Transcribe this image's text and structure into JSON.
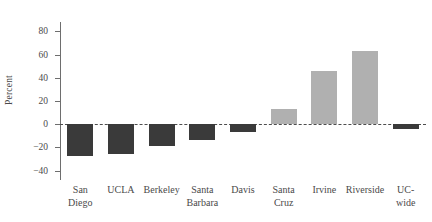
{
  "chart_data": {
    "type": "bar",
    "title": "",
    "subtitle": "",
    "xlabel": "",
    "ylabel": "Percent",
    "categories": [
      "San Diego",
      "UCLA",
      "Berkeley",
      "Santa Barbara",
      "Davis",
      "Santa Cruz",
      "Irvine",
      "Riverside",
      "UC-wide"
    ],
    "category_lines": [
      [
        "San",
        "Diego"
      ],
      [
        "UCLA",
        ""
      ],
      [
        "Berkeley",
        ""
      ],
      [
        "Santa",
        "Barbara"
      ],
      [
        "Davis",
        ""
      ],
      [
        "Santa",
        "Cruz"
      ],
      [
        "Irvine",
        ""
      ],
      [
        "Riverside",
        ""
      ],
      [
        "UC-",
        "wide"
      ]
    ],
    "values": [
      -27,
      -26,
      -19,
      -14,
      -7,
      13,
      46,
      63,
      -4
    ],
    "ylim": [
      -48,
      88
    ],
    "yticks": [
      80,
      60,
      40,
      20,
      0,
      -20,
      -40
    ],
    "ytick_labels": [
      "80",
      "60",
      "40",
      "20",
      "0",
      "−20",
      "−40"
    ],
    "grid": false,
    "legend": "none",
    "zero_reference_line": true,
    "colors": {
      "negative_bar": "#3a3a3a",
      "positive_bar": "#b0b0b0",
      "axis": "#6e6e6e",
      "zero_line": "#4d4d4d",
      "text": "#4a4a4a",
      "background": "#ffffff"
    }
  }
}
